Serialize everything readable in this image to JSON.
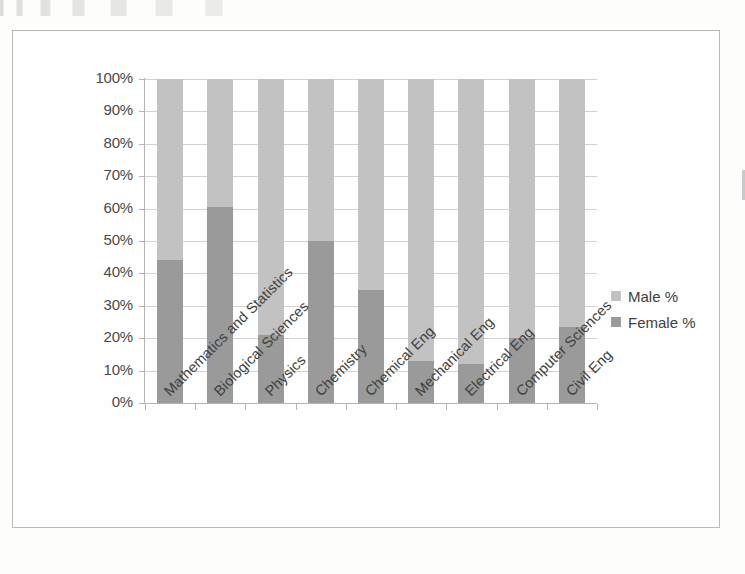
{
  "chart_data": {
    "type": "bar",
    "subtype": "100% stacked bar",
    "title": "",
    "xlabel": "",
    "ylabel": "",
    "ylim": [
      0,
      100
    ],
    "grid": true,
    "legend_position": "right",
    "categories": [
      "Mathematics and Statistics",
      "Biological Sciences",
      "Physics",
      "Chemistry",
      "Chemical Eng",
      "Mechanical Eng",
      "Electrical Eng",
      "Computer Sciences",
      "Civil Eng"
    ],
    "series": [
      {
        "name": "Female %",
        "color": "#9a9a9a",
        "values": [
          44,
          60.5,
          21,
          50,
          35,
          13,
          12,
          20,
          23.5
        ]
      },
      {
        "name": "Male %",
        "color": "#c2c2c2",
        "values": [
          56,
          39.5,
          79,
          50,
          65,
          87,
          88,
          80,
          76.5
        ]
      }
    ],
    "y_ticks": [
      {
        "value": 100,
        "label": "100%"
      },
      {
        "value": 90,
        "label": "90%"
      },
      {
        "value": 80,
        "label": "80%"
      },
      {
        "value": 70,
        "label": "70%"
      },
      {
        "value": 60,
        "label": "60%"
      },
      {
        "value": 50,
        "label": "50%"
      },
      {
        "value": 40,
        "label": "40%"
      },
      {
        "value": 30,
        "label": "30%"
      },
      {
        "value": 20,
        "label": "20%"
      },
      {
        "value": 10,
        "label": "10%"
      },
      {
        "value": 0,
        "label": "0%"
      }
    ],
    "legend": [
      {
        "label": "Male %",
        "color": "#c2c2c2"
      },
      {
        "label": "Female %",
        "color": "#9a9a9a"
      }
    ]
  }
}
